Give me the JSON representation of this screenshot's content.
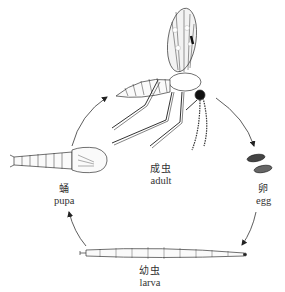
{
  "diagram": {
    "type": "cycle",
    "stages": [
      {
        "id": "adult",
        "zh": "成虫",
        "en": "adult"
      },
      {
        "id": "egg",
        "zh": "卵",
        "en": "egg"
      },
      {
        "id": "larva",
        "zh": "幼虫",
        "en": "larva"
      },
      {
        "id": "pupa",
        "zh": "蛹",
        "en": "pupa"
      }
    ],
    "edges": [
      {
        "from": "adult",
        "to": "egg"
      },
      {
        "from": "egg",
        "to": "larva"
      },
      {
        "from": "larva",
        "to": "pupa"
      },
      {
        "from": "pupa",
        "to": "adult"
      }
    ],
    "colors": {
      "ink": "#222222",
      "background": "#ffffff"
    }
  }
}
